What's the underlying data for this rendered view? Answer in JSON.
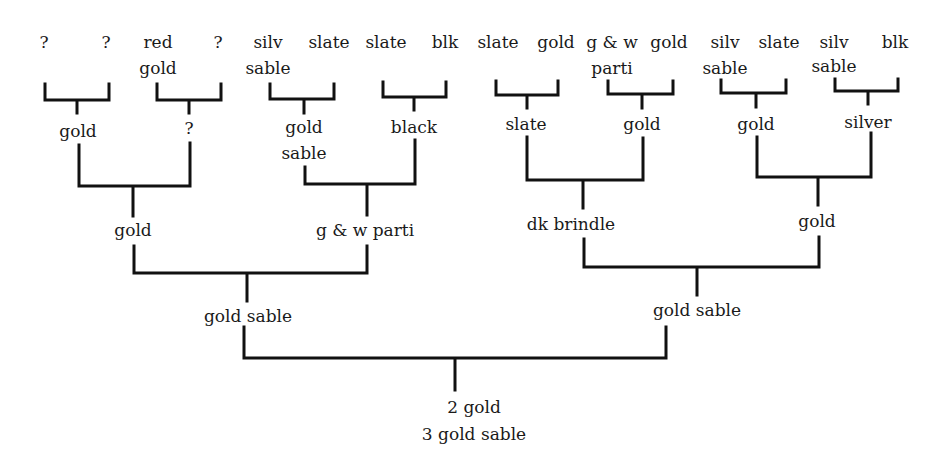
{
  "diagram": {
    "type": "pedigree",
    "generation_4_great_grandparents": [
      {
        "text": "?"
      },
      {
        "text": "?"
      },
      {
        "text": "red",
        "text2": "gold"
      },
      {
        "text": "?"
      },
      {
        "text": "silv",
        "text2": "sable"
      },
      {
        "text": "slate"
      },
      {
        "text": "slate"
      },
      {
        "text": "blk"
      },
      {
        "text": "slate"
      },
      {
        "text": "gold"
      },
      {
        "text": "g & w",
        "text2": "parti"
      },
      {
        "text": "gold"
      },
      {
        "text": "silv",
        "text2": "sable"
      },
      {
        "text": "slate"
      },
      {
        "text": "silv",
        "text2": "sable"
      },
      {
        "text": "blk"
      }
    ],
    "generation_3_grandparents": [
      {
        "text": "gold"
      },
      {
        "text": "?"
      },
      {
        "text": "gold",
        "text2": "sable"
      },
      {
        "text": "black"
      },
      {
        "text": "slate"
      },
      {
        "text": "gold"
      },
      {
        "text": "gold"
      },
      {
        "text": "silver"
      }
    ],
    "generation_2_grandparents": [
      {
        "text": "gold"
      },
      {
        "text": "g & w parti"
      },
      {
        "text": "dk brindle"
      },
      {
        "text": "gold"
      }
    ],
    "generation_1_parents": [
      {
        "text": "gold sable"
      },
      {
        "text": "gold sable"
      }
    ],
    "offspring": {
      "line1": "2 gold",
      "line2": "3 gold sable"
    },
    "line_color": "#111111"
  }
}
